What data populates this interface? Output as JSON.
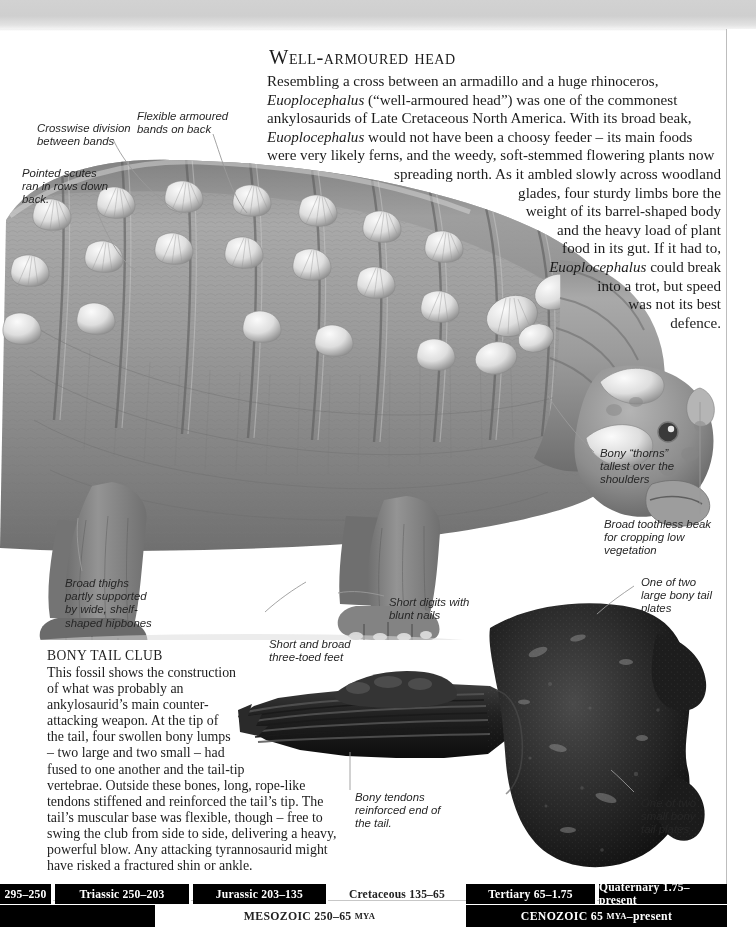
{
  "page": {
    "headline": "Well-armoured head",
    "headline_first_letter": "W"
  },
  "body": {
    "lines": [
      "Resembling a cross between an armadillo and a huge rhinoceros,",
      "Euoplocephalus (“well-armoured head”) was one of the commonest",
      "ankylosaurids of Late Cretaceous North America. With its broad beak,",
      "Euoplocephalus would not have been a choosy feeder – its main foods",
      "were very likely ferns, and the weedy, soft-stemmed flowering plants now",
      "spreading north. As it ambled slowly across woodland",
      "glades, four sturdy limbs bore the",
      "weight of its barrel-shaped body",
      "and the heavy load of plant",
      "food in its gut. If it had to,",
      "Euoplocephalus could break",
      "into a trot, but speed",
      "was not its best",
      "defence."
    ]
  },
  "fossil_caption": {
    "title": "BONY TAIL CLUB",
    "lines": [
      "This fossil shows the construction",
      "of what was probably an",
      "ankylosaurid’s main counter-",
      "attacking weapon. At the tip of",
      "the tail, four swollen bony lumps",
      "– two large and two small – had",
      "fused to one another and the tail-tip",
      "vertebrae. Outside these bones, long, rope-like",
      "tendons stiffened and reinforced the tail’s tip. The",
      "tail’s muscular base was flexible, though – free to",
      "swing the club from side to side, delivering a heavy,",
      "powerful blow. Any attacking tyrannosaurid might",
      "have risked a fractured shin or ankle."
    ]
  },
  "annotations": [
    {
      "id": "crosswise-division",
      "lines": [
        "Crosswise division",
        "between bands"
      ]
    },
    {
      "id": "flexible-bands",
      "lines": [
        "Flexible armoured",
        "bands on back"
      ]
    },
    {
      "id": "pointed-scutes",
      "lines": [
        "Pointed scutes",
        "ran in rows down",
        "back."
      ]
    },
    {
      "id": "bony-thorns",
      "lines": [
        "Bony “thorns”",
        "tallest over the",
        "shoulders"
      ]
    },
    {
      "id": "toothless-beak",
      "lines": [
        "Broad toothless beak",
        "for cropping low",
        "vegetation"
      ]
    },
    {
      "id": "broad-thighs",
      "lines": [
        "Broad thighs",
        "partly supported",
        "by wide, shelf-",
        "shaped hipbones"
      ]
    },
    {
      "id": "short-digits",
      "lines": [
        "Short digits with",
        "blunt nails"
      ]
    },
    {
      "id": "three-toed-feet",
      "lines": [
        "Short and broad",
        "three-toed feet"
      ]
    },
    {
      "id": "bony-tendons",
      "lines": [
        "Bony tendons",
        "reinforced end of",
        "the tail."
      ]
    },
    {
      "id": "large-tail-plates",
      "lines": [
        "One of two",
        "large bony tail",
        "plates"
      ]
    },
    {
      "id": "small-tail-plates",
      "lines": [
        "One of two",
        "small bony",
        "tail plates"
      ]
    }
  ],
  "timeline": {
    "periods": [
      {
        "label": "295–250",
        "left": 0,
        "width": 53,
        "inverted": false
      },
      {
        "label": "Triassic 250–203",
        "left": 55,
        "width": 136,
        "inverted": false
      },
      {
        "label": "Jurassic 203–135",
        "left": 193,
        "width": 135,
        "inverted": false
      },
      {
        "label": "Cretaceous 135–65",
        "left": 330,
        "width": 134,
        "inverted": true
      },
      {
        "label": "Tertiary 65–1.75",
        "left": 466,
        "width": 131,
        "inverted": false
      },
      {
        "label": "Quaternary 1.75–present",
        "left": 599,
        "width": 128,
        "inverted": false
      }
    ],
    "eras": [
      {
        "label": "MESOZOIC 250–65 ",
        "small": "MYA",
        "tail": "",
        "left": 0,
        "width": 155,
        "inverted": true
      },
      {
        "label": "MESOZOIC 250–65 ",
        "small": "MYA",
        "tail": "",
        "left": 155,
        "width": 309,
        "inverted": true,
        "show": true
      },
      {
        "label": "CENOZOIC 65 ",
        "small": "MYA",
        "tail": "–present",
        "left": 466,
        "width": 261,
        "inverted": false,
        "show": true
      }
    ],
    "mesozoic_label": "MESOZOIC 250–65",
    "mesozoic_small": "MYA",
    "cenozoic_label": "CENOZOIC 65",
    "cenozoic_small": "MYA",
    "cenozoic_tail": "–present"
  },
  "colors": {
    "ink": "#1c1c1c",
    "leader": "#8d8d8d",
    "band": "#d2d2d2",
    "timeline_bg": "#000000",
    "timeline_fg": "#ffffff"
  }
}
